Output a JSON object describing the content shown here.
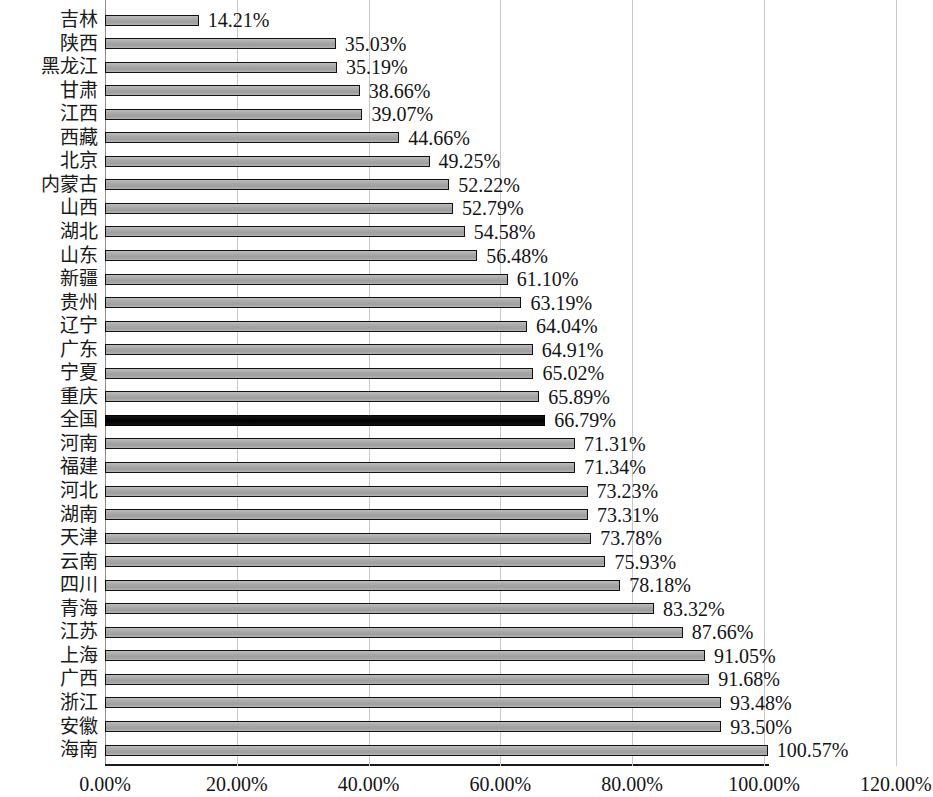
{
  "chart_data": {
    "type": "bar",
    "orientation": "horizontal",
    "title": "",
    "subtitle": "",
    "xlabel": "",
    "ylabel": "",
    "xlim": [
      0,
      120
    ],
    "grid": true,
    "legend_position": "none",
    "x_tick_labels": [
      "0.00%",
      "20.00%",
      "40.00%",
      "60.00%",
      "80.00%",
      "100.00%",
      "120.00%"
    ],
    "x_tick_values": [
      0,
      20,
      40,
      60,
      80,
      100,
      120
    ],
    "value_suffix": "%",
    "highlight_category": "全国",
    "highlight_color": "#0a0a0a",
    "bar_color": "#a6a6a6",
    "bar_border_color": "#111111",
    "categories": [
      "吉林",
      "陕西",
      "黑龙江",
      "甘肃",
      "江西",
      "西藏",
      "北京",
      "内蒙古",
      "山西",
      "湖北",
      "山东",
      "新疆",
      "贵州",
      "辽宁",
      "广东",
      "宁夏",
      "重庆",
      "全国",
      "河南",
      "福建",
      "河北",
      "湖南",
      "天津",
      "云南",
      "四川",
      "青海",
      "江苏",
      "上海",
      "广西",
      "浙江",
      "安徽",
      "海南"
    ],
    "values": [
      14.21,
      35.03,
      35.19,
      38.66,
      39.07,
      44.66,
      49.25,
      52.22,
      52.79,
      54.58,
      56.48,
      61.1,
      63.19,
      64.04,
      64.91,
      65.02,
      65.89,
      66.79,
      71.31,
      71.34,
      73.23,
      73.31,
      73.78,
      75.93,
      78.18,
      83.32,
      87.66,
      91.05,
      91.68,
      93.48,
      93.5,
      100.57
    ],
    "data_labels": [
      "14.21%",
      "35.03%",
      "35.19%",
      "38.66%",
      "39.07%",
      "44.66%",
      "49.25%",
      "52.22%",
      "52.79%",
      "54.58%",
      "56.48%",
      "61.10%",
      "63.19%",
      "64.04%",
      "64.91%",
      "65.02%",
      "65.89%",
      "66.79%",
      "71.31%",
      "71.34%",
      "73.23%",
      "73.31%",
      "73.78%",
      "75.93%",
      "78.18%",
      "83.32%",
      "87.66%",
      "91.05%",
      "91.68%",
      "93.48%",
      "93.50%",
      "100.57%"
    ]
  }
}
